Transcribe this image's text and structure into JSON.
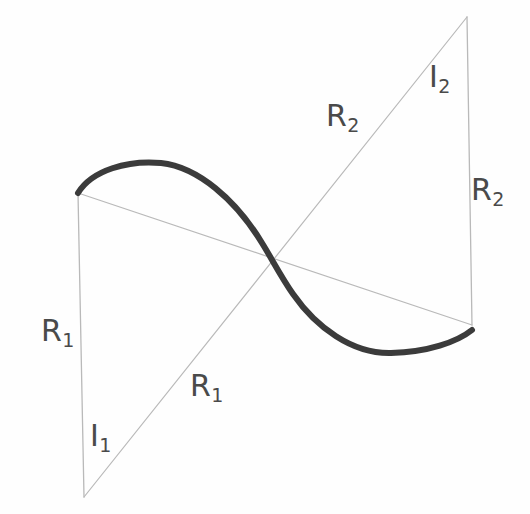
{
  "figure": {
    "background_color": "#fefefe",
    "thin_line_color": "#b9b9b9",
    "curve_color": "#3b3b3b",
    "label_color": "#4a4a4a",
    "vertices": {
      "top_left": {
        "x": 78,
        "y": 193
      },
      "bottom_left": {
        "x": 84,
        "y": 497
      },
      "top_right": {
        "x": 467,
        "y": 17
      },
      "bottom_right": {
        "x": 472,
        "y": 325
      },
      "crossing": {
        "x": 275,
        "y": 263
      }
    },
    "lines": [
      {
        "name": "left-vertical-line",
        "from": "top_left",
        "to": "bottom_left",
        "label": "R_1"
      },
      {
        "name": "right-vertical-line",
        "from": "top_right",
        "to": "bottom_right",
        "label": "R_2"
      },
      {
        "name": "descending-diagonal",
        "from": "top_left",
        "to": "bottom_right",
        "label": "R_1"
      },
      {
        "name": "ascending-diagonal",
        "from": "bottom_left",
        "to": "top_right",
        "label": "R_2"
      }
    ],
    "curve": {
      "name": "sine-curve",
      "start": {
        "x": 78,
        "y": 193
      },
      "end": {
        "x": 472,
        "y": 330
      },
      "peak": {
        "x": 160,
        "y": 162
      },
      "trough": {
        "x": 389,
        "y": 353
      },
      "stroke_width": 6
    }
  },
  "labels": {
    "r1_left": {
      "base": "R",
      "sub": "1"
    },
    "i1": {
      "base": "I",
      "sub": "1"
    },
    "r1_mid": {
      "base": "R",
      "sub": "1"
    },
    "r2_mid": {
      "base": "R",
      "sub": "2"
    },
    "i2": {
      "base": "I",
      "sub": "2"
    },
    "r2_right": {
      "base": "R",
      "sub": "2"
    }
  }
}
